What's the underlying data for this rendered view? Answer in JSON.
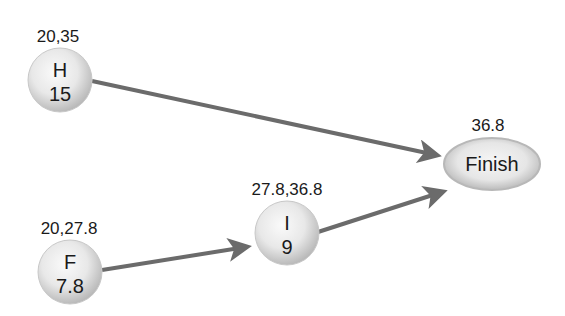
{
  "diagram": {
    "type": "project-network",
    "nodes": [
      {
        "id": "H",
        "name": "H",
        "duration": "15",
        "times": "20,35",
        "cx": 60,
        "cy": 80,
        "shape": "circle"
      },
      {
        "id": "F",
        "name": "F",
        "duration": "7.8",
        "times": "20,27.8",
        "cx": 70,
        "cy": 272,
        "shape": "circle"
      },
      {
        "id": "I",
        "name": "I",
        "duration": "9",
        "times": "27.8,36.8",
        "cx": 287,
        "cy": 233,
        "shape": "circle"
      },
      {
        "id": "Finish",
        "name": "Finish",
        "times": "36.8",
        "cx": 492,
        "cy": 164,
        "shape": "ellipse"
      }
    ],
    "edges": [
      {
        "from": "H",
        "to": "Finish"
      },
      {
        "from": "F",
        "to": "I"
      },
      {
        "from": "I",
        "to": "Finish"
      }
    ],
    "colors": {
      "arrow": "#6b6b6b",
      "node_fill_light": "#f4f4f4",
      "node_fill_dark": "#bdbdbd",
      "text": "#1a1a1a"
    }
  }
}
